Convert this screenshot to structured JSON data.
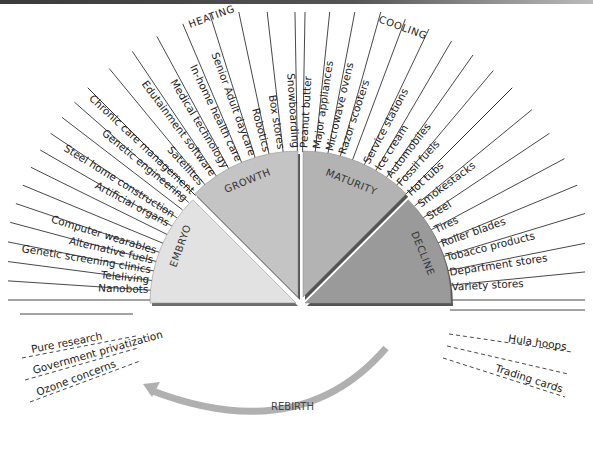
{
  "diagram": {
    "zones": {
      "heating": "HEATING",
      "cooling": "COOLING"
    },
    "phases": [
      {
        "id": "embryo",
        "label": "EMBRYO",
        "color": "#e2e2e2",
        "shadow": "#6d6d6d"
      },
      {
        "id": "growth",
        "label": "GROWTH",
        "color": "#c4c4c4",
        "shadow": "#555555"
      },
      {
        "id": "maturity",
        "label": "MATURITY",
        "color": "#b3b3b3",
        "shadow": "#555555"
      },
      {
        "id": "decline",
        "label": "DECLINE",
        "color": "#9a9a9a",
        "shadow": "#555555"
      }
    ],
    "embryo_items": [
      "Nanobots",
      "Teleliving",
      "Genetic screening clinics",
      "Alternative fuels",
      "Computer wearables",
      "",
      "",
      "Artificial organs",
      "Steel home construction",
      "",
      "Genetic engineering",
      "Chronic care management"
    ],
    "growth_items": [
      "Satellites",
      "Edutainment software",
      "Medical technology",
      "In-home health care",
      "Senior Adult daycare",
      "Robotics",
      "Box stores",
      "Snowboarding"
    ],
    "maturity_items": [
      "Peanut butter",
      "Major appliances",
      "Microwave ovens",
      "Razor scooters",
      "",
      "Service stations",
      "Ice cream",
      "Automobiles",
      "Fossil fuels"
    ],
    "decline_items": [
      "Hot tubs",
      "Smokestacks",
      "Steel",
      "Tires",
      "Roller blades",
      "Tobacco products",
      "Department stores",
      "Variety stores"
    ],
    "rebirth": {
      "label": "REBIRTH",
      "arrow_color": "#b0b0b0",
      "left_items": [
        "Pure research",
        "Government privatization",
        "Ozone concerns"
      ],
      "right_items": [
        "Hula hoops",
        "",
        "Trading cards"
      ]
    }
  }
}
